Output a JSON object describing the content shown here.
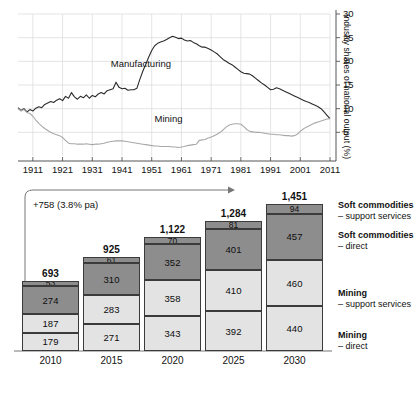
{
  "chart_data": [
    {
      "type": "line",
      "id": "industry-shares-line",
      "title": "",
      "xlabel": "",
      "ylabel": "Industry shares of national output (%)",
      "ylim": [
        0,
        30
      ],
      "yticks": [
        5,
        10,
        15,
        20,
        25,
        30
      ],
      "xticks": [
        "1911",
        "1921",
        "1931",
        "1941",
        "1951",
        "1961",
        "1971",
        "1981",
        "1991",
        "2001",
        "2011"
      ],
      "xlim": [
        1906,
        2011
      ],
      "grid": true,
      "legend_position": "inline-annotation",
      "series": [
        {
          "name": "Manufacturing",
          "color": "#2b2b2b",
          "label_x": 1948,
          "label_y": 19.5,
          "x": [
            1906,
            1907,
            1908,
            1909,
            1910,
            1911,
            1912,
            1913,
            1914,
            1915,
            1916,
            1917,
            1918,
            1919,
            1920,
            1921,
            1922,
            1923,
            1924,
            1925,
            1926,
            1927,
            1928,
            1929,
            1930,
            1931,
            1932,
            1933,
            1934,
            1935,
            1936,
            1937,
            1938,
            1939,
            1940,
            1941,
            1942,
            1943,
            1944,
            1945,
            1946,
            1947,
            1948,
            1949,
            1950,
            1951,
            1952,
            1953,
            1954,
            1955,
            1956,
            1957,
            1958,
            1959,
            1960,
            1961,
            1962,
            1963,
            1964,
            1965,
            1966,
            1967,
            1968,
            1969,
            1970,
            1971,
            1972,
            1973,
            1974,
            1975,
            1976,
            1977,
            1978,
            1979,
            1980,
            1981,
            1982,
            1983,
            1984,
            1985,
            1986,
            1987,
            1988,
            1989,
            1990,
            1991,
            1992,
            1993,
            1994,
            1995,
            1996,
            1997,
            1998,
            1999,
            2000,
            2001,
            2002,
            2003,
            2004,
            2005,
            2006,
            2007,
            2008,
            2009,
            2010,
            2011
          ],
          "y": [
            10.2,
            9.6,
            10.0,
            9.3,
            9.8,
            9.5,
            10.1,
            10.4,
            10.2,
            10.9,
            11.2,
            11.5,
            11.3,
            11.8,
            12.1,
            11.7,
            12.6,
            12.2,
            13.4,
            12.5,
            12.0,
            12.6,
            12.3,
            12.9,
            12.2,
            12.8,
            12.5,
            13.1,
            13.4,
            13.1,
            13.8,
            14.0,
            14.2,
            15.6,
            14.5,
            14.2,
            14.3,
            13.9,
            14.0,
            14.0,
            14.3,
            16.2,
            17.9,
            19.4,
            20.9,
            22.3,
            23.3,
            23.8,
            24.1,
            24.3,
            24.6,
            25.0,
            25.3,
            25.1,
            24.8,
            24.9,
            24.5,
            24.3,
            24.4,
            24.0,
            23.7,
            23.3,
            23.0,
            23.0,
            22.7,
            22.4,
            22.0,
            21.6,
            21.0,
            20.4,
            20.0,
            19.6,
            19.3,
            18.8,
            18.3,
            17.8,
            17.5,
            17.4,
            17.3,
            16.9,
            16.4,
            15.9,
            15.4,
            15.0,
            14.5,
            14.0,
            14.1,
            14.4,
            14.2,
            13.9,
            13.6,
            13.3,
            13.0,
            12.7,
            12.4,
            12.1,
            11.8,
            11.5,
            11.3,
            11.0,
            10.7,
            10.4,
            10.0,
            9.3,
            8.6,
            7.9
          ]
        },
        {
          "name": "Mining",
          "color": "#a8a8a8",
          "label_x": 1958,
          "label_y": 7.8,
          "x": [
            1906,
            1907,
            1908,
            1909,
            1910,
            1911,
            1912,
            1913,
            1914,
            1915,
            1916,
            1917,
            1918,
            1919,
            1920,
            1921,
            1922,
            1923,
            1924,
            1925,
            1926,
            1927,
            1928,
            1929,
            1930,
            1931,
            1932,
            1933,
            1934,
            1935,
            1936,
            1937,
            1938,
            1939,
            1940,
            1941,
            1942,
            1943,
            1944,
            1945,
            1946,
            1947,
            1948,
            1949,
            1950,
            1951,
            1952,
            1953,
            1954,
            1955,
            1956,
            1957,
            1958,
            1959,
            1960,
            1961,
            1962,
            1963,
            1964,
            1965,
            1966,
            1967,
            1968,
            1969,
            1970,
            1971,
            1972,
            1973,
            1974,
            1975,
            1976,
            1977,
            1978,
            1979,
            1980,
            1981,
            1982,
            1983,
            1984,
            1985,
            1986,
            1987,
            1988,
            1989,
            1990,
            1991,
            1992,
            1993,
            1994,
            1995,
            1996,
            1997,
            1998,
            1999,
            2000,
            2001,
            2002,
            2003,
            2004,
            2005,
            2006,
            2007,
            2008,
            2009,
            2010,
            2011
          ],
          "y": [
            10.0,
            9.5,
            9.8,
            9.2,
            9.0,
            8.4,
            7.6,
            6.9,
            6.3,
            5.8,
            5.4,
            5.0,
            4.7,
            4.5,
            4.3,
            3.9,
            3.3,
            2.7,
            2.6,
            2.6,
            2.5,
            2.5,
            2.5,
            2.6,
            2.5,
            2.4,
            2.5,
            2.5,
            2.6,
            2.7,
            2.9,
            3.0,
            3.1,
            3.2,
            3.2,
            3.2,
            3.1,
            3.0,
            2.9,
            2.8,
            2.7,
            2.6,
            2.5,
            2.4,
            2.3,
            2.2,
            2.1,
            2.1,
            2.0,
            2.0,
            2.0,
            2.0,
            1.9,
            1.9,
            1.8,
            1.9,
            2.0,
            2.2,
            2.3,
            2.4,
            2.5,
            3.3,
            3.4,
            3.5,
            3.8,
            4.0,
            4.3,
            4.6,
            5.0,
            5.5,
            6.1,
            6.5,
            6.7,
            6.8,
            6.8,
            6.7,
            6.2,
            5.6,
            5.2,
            5.1,
            5.0,
            5.0,
            4.9,
            4.8,
            4.7,
            4.6,
            4.6,
            4.5,
            4.5,
            4.4,
            4.3,
            4.3,
            4.2,
            4.3,
            4.6,
            5.2,
            5.7,
            6.1,
            6.4,
            6.7,
            7.0,
            7.2,
            7.4,
            7.6,
            7.8,
            7.9
          ]
        }
      ]
    },
    {
      "type": "bar",
      "id": "outlook-stacked-bar",
      "stacked": true,
      "title": "",
      "xlabel": "",
      "ylabel": "",
      "categories": [
        "2010",
        "2015",
        "2020",
        "2025",
        "2030"
      ],
      "totals": [
        693,
        925,
        1122,
        1284,
        1451
      ],
      "total_labels": [
        "693",
        "925",
        "1,122",
        "1,284",
        "1,451"
      ],
      "ylim": [
        0,
        1451
      ],
      "grid": false,
      "legend_position": "right",
      "annotation": "+758 (3.8% pa)",
      "series": [
        {
          "name": "Mining – direct",
          "legend_title": "Mining",
          "legend_sub": "– direct",
          "color": "#e3e3e3",
          "values": [
            179,
            271,
            343,
            392,
            440
          ]
        },
        {
          "name": "Mining – support services",
          "legend_title": "Mining",
          "legend_sub": "– support services",
          "color": "#e3e3e3",
          "values": [
            187,
            283,
            358,
            410,
            460
          ]
        },
        {
          "name": "Soft commodities – direct",
          "legend_title": "Soft commodities",
          "legend_sub": "– direct",
          "color": "#8d8d8d",
          "values": [
            274,
            310,
            352,
            401,
            457
          ]
        },
        {
          "name": "Soft commodities – support services",
          "legend_title": "Soft commodities",
          "legend_sub": "– support services",
          "color": "#8d8d8d",
          "values": [
            53,
            61,
            70,
            81,
            94
          ]
        }
      ]
    }
  ],
  "line_chart": {
    "yticks": [
      "5",
      "10",
      "15",
      "20",
      "25",
      "30"
    ],
    "xticks": [
      "1911",
      "1921",
      "1931",
      "1941",
      "1951",
      "1961",
      "1971",
      "1981",
      "1991",
      "2001",
      "2011"
    ],
    "ylabel": "Industry shares of national output (%)",
    "series_labels": {
      "manufacturing": "Manufacturing",
      "mining": "Mining"
    }
  },
  "bar_chart": {
    "annotation": "+758 (3.8% pa)",
    "categories": [
      "2010",
      "2015",
      "2020",
      "2025",
      "2030"
    ],
    "totals": [
      "693",
      "925",
      "1,122",
      "1,284",
      "1,451"
    ],
    "cols": [
      {
        "year": "2010",
        "segs": [
          "53",
          "274",
          "187",
          "179"
        ]
      },
      {
        "year": "2015",
        "segs": [
          "61",
          "310",
          "283",
          "271"
        ]
      },
      {
        "year": "2020",
        "segs": [
          "70",
          "352",
          "358",
          "343"
        ]
      },
      {
        "year": "2025",
        "segs": [
          "81",
          "401",
          "410",
          "392"
        ]
      },
      {
        "year": "2030",
        "segs": [
          "94",
          "457",
          "460",
          "440"
        ]
      }
    ],
    "legend": [
      {
        "title": "Soft commodities",
        "sub": "– support services"
      },
      {
        "title": "Soft commodities",
        "sub": "– direct"
      },
      {
        "title": "Mining",
        "sub": "– support services"
      },
      {
        "title": "Mining",
        "sub": "– direct"
      }
    ]
  },
  "colors": {
    "dark_segment": "#8d8d8d",
    "light_segment": "#e3e3e3",
    "manufacturing_line": "#2b2b2b",
    "mining_line": "#a8a8a8",
    "grid": "#d8d8d8",
    "axis": "#555555"
  }
}
